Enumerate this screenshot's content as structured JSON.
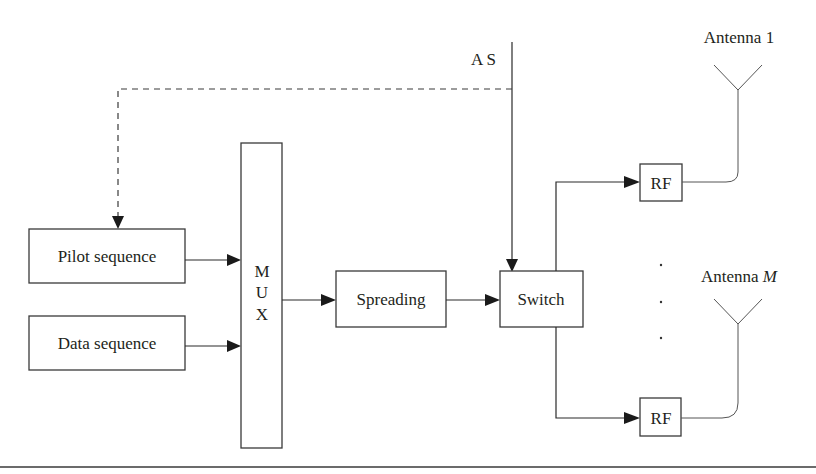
{
  "diagram": {
    "type": "block-diagram",
    "control_label": "A S",
    "blocks": {
      "pilot": "Pilot sequence",
      "data": "Data sequence",
      "mux_letters": [
        "M",
        "U",
        "X"
      ],
      "spreading": "Spreading",
      "switch": "Switch",
      "rf_top": "RF",
      "rf_bottom": "RF"
    },
    "antennas": {
      "top": "Antenna 1",
      "bottom_prefix": "Antenna ",
      "bottom_index": "M"
    },
    "ellipsis": [
      "·",
      "·",
      "·"
    ],
    "connections": [
      {
        "from": "A S",
        "to": "Switch",
        "style": "solid"
      },
      {
        "from": "A S",
        "to": "Pilot sequence",
        "style": "dashed"
      },
      {
        "from": "Pilot sequence",
        "to": "MUX",
        "style": "solid"
      },
      {
        "from": "Data sequence",
        "to": "MUX",
        "style": "solid"
      },
      {
        "from": "MUX",
        "to": "Spreading",
        "style": "solid"
      },
      {
        "from": "Spreading",
        "to": "Switch",
        "style": "solid"
      },
      {
        "from": "Switch",
        "to": "RF (top)",
        "style": "solid"
      },
      {
        "from": "Switch",
        "to": "RF (bottom)",
        "style": "solid"
      },
      {
        "from": "RF (top)",
        "to": "Antenna 1",
        "style": "solid"
      },
      {
        "from": "RF (bottom)",
        "to": "Antenna M",
        "style": "solid"
      }
    ],
    "colors": {
      "line": "#2a2a2a",
      "text": "#231f20",
      "background": "#ffffff"
    }
  }
}
